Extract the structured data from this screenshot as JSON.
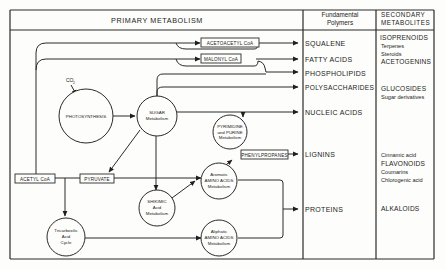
{
  "diagram": {
    "headers": {
      "primary": "PRIMARY METABOLISM",
      "polymers_line1": "Fundamental",
      "polymers_line2": "Polymers",
      "secondary_line1": "SECONDARY",
      "secondary_line2": "METABOLITES"
    },
    "nodes": {
      "photosynthesis": {
        "label": "PHOTOSYNTHESIS"
      },
      "co2": {
        "label": "CO",
        "sub": "2"
      },
      "sugar": {
        "line1": "SUGAR",
        "line2": "Metabolism"
      },
      "pyrimidine": {
        "line1": "PYRIMIDINE",
        "line2": "and PURINE",
        "line3": "Metabolism"
      },
      "aromatic": {
        "line1": "Aromatic",
        "line2": "AMINO ACIDS",
        "line3": "Metabolism"
      },
      "shikimic": {
        "line1": "SHIKIMIC",
        "line2": "Acid",
        "line3": "Metabolism"
      },
      "tca": {
        "line1": "Tricarboxilic",
        "line2": "Acid",
        "line3": "Cycle"
      },
      "aliphatic": {
        "line1": "Aliphatic",
        "line2": "AMINO ACIDS",
        "line3": "Metabolism"
      }
    },
    "boxes": {
      "acetoacetyl": "ACETOACETYL CoA",
      "malonyl": "MALONYL CoA",
      "acetyl": "ACETYL CoA",
      "pyruvate": "PYRUVATE",
      "phenylpropanes": "PHENYLPROPANES"
    },
    "polymers": [
      "SQUALENE",
      "FATTY ACIDS",
      "PHOSPHOLIPIDS",
      "POLYSACCHARIDES",
      "NUCLEIC ACIDS",
      "LIGNINS",
      "PROTEINS"
    ],
    "secondary": {
      "isoprenoids": "ISOPRENOIDS",
      "terpenes": "Terpenes",
      "steroids": "Steroids",
      "acetogenins": "ACETOGENINS",
      "glucosides": "GLUCOSIDES",
      "sugar_derivatives": "Sugar derivatives",
      "cinnamic": "Cinnamic acid",
      "flavonoids": "FLAVONOIDS",
      "coumarins": "Coumarins",
      "chlorogenic": "Chlorogenic acid",
      "alkaloids": "ALKALOIDS"
    }
  }
}
